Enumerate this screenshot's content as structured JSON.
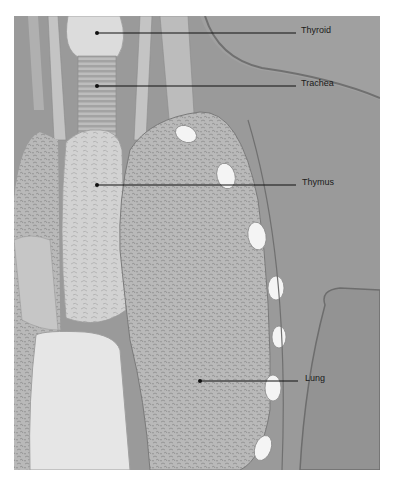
{
  "figure": {
    "labels": [
      {
        "id": "thyroid",
        "text": "Thyroid",
        "dot": [
          97,
          33
        ],
        "line_end": [
          296,
          33
        ],
        "text_pos": [
          301,
          28
        ]
      },
      {
        "id": "trachea",
        "text": "Trachea",
        "dot": [
          97,
          86
        ],
        "line_end": [
          296,
          86
        ],
        "text_pos": [
          301,
          81
        ]
      },
      {
        "id": "thymus",
        "text": "Thymus",
        "dot": [
          97,
          185
        ],
        "line_end": [
          296,
          185
        ],
        "text_pos": [
          302,
          180
        ]
      },
      {
        "id": "lung",
        "text": "Lung",
        "dot": [
          200,
          381
        ],
        "line_end": [
          298,
          381
        ],
        "text_pos": [
          305,
          376
        ]
      }
    ],
    "colors": {
      "background_tissue": "#9a9a9a",
      "light_organ": "#dcdcdc",
      "lung": "#b8b8b8",
      "rib_cartilage": "#f4f4f4",
      "line": "#111111"
    }
  }
}
